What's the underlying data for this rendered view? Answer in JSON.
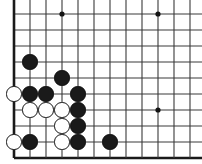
{
  "diagram": {
    "kind": "go-board-diagram"
  },
  "board": {
    "size": 19,
    "visible_columns": 12,
    "visible_rows": 10,
    "origin_x": 14,
    "origin_y": 14,
    "cell": 16,
    "line_color": "#3a3a3a",
    "edge_color": "#1a1a1a",
    "line_width": 1.1,
    "edge_width": 2.6,
    "background_color": "#ffffff",
    "left_edge_visible": true,
    "bottom_edge_visible": true,
    "top_edge_visible": false,
    "right_edge_visible": false,
    "columns_px": [
      14,
      30,
      46,
      62,
      78,
      94,
      110,
      126,
      142,
      158,
      174,
      190
    ],
    "rows_px": [
      14,
      30,
      46,
      62,
      78,
      94,
      110,
      126,
      142,
      158
    ]
  },
  "star_points": {
    "color": "#141414",
    "radius": 2.6,
    "points": [
      {
        "name": "star-point-top-left",
        "col": 3,
        "row": 0,
        "x": 62,
        "y": 14
      },
      {
        "name": "star-point-top-right",
        "col": 9,
        "row": 0,
        "x": 158,
        "y": 14
      },
      {
        "name": "star-point-center-right",
        "col": 9,
        "row": 6,
        "x": 158,
        "y": 110
      }
    ]
  },
  "stones": {
    "radius": 7.6,
    "black_color": "#1a1a1a",
    "white_color": "#ffffff",
    "white_outline_color": "#141414",
    "items": [
      {
        "name": "stone-black-b4",
        "color": "black",
        "col": 1,
        "row": 3,
        "x": 30,
        "y": 62
      },
      {
        "name": "stone-black-d5",
        "color": "black",
        "col": 3,
        "row": 4,
        "x": 62,
        "y": 78
      },
      {
        "name": "stone-white-a6",
        "color": "white",
        "col": 0,
        "row": 5,
        "x": 14,
        "y": 94
      },
      {
        "name": "stone-black-b6",
        "color": "black",
        "col": 1,
        "row": 5,
        "x": 30,
        "y": 94
      },
      {
        "name": "stone-black-c6",
        "color": "black",
        "col": 2,
        "row": 5,
        "x": 46,
        "y": 94
      },
      {
        "name": "stone-black-e6",
        "color": "black",
        "col": 4,
        "row": 5,
        "x": 78,
        "y": 94
      },
      {
        "name": "stone-white-b7",
        "color": "white",
        "col": 1,
        "row": 6,
        "x": 30,
        "y": 110
      },
      {
        "name": "stone-white-c7",
        "color": "white",
        "col": 2,
        "row": 6,
        "x": 46,
        "y": 110
      },
      {
        "name": "stone-white-d7",
        "color": "white",
        "col": 3,
        "row": 6,
        "x": 62,
        "y": 110
      },
      {
        "name": "stone-black-e7",
        "color": "black",
        "col": 4,
        "row": 6,
        "x": 78,
        "y": 110
      },
      {
        "name": "stone-white-d8",
        "color": "white",
        "col": 3,
        "row": 7,
        "x": 62,
        "y": 126
      },
      {
        "name": "stone-black-e8",
        "color": "black",
        "col": 4,
        "row": 7,
        "x": 78,
        "y": 126
      },
      {
        "name": "stone-white-a9",
        "color": "white",
        "col": 0,
        "row": 8,
        "x": 14,
        "y": 142
      },
      {
        "name": "stone-black-b9",
        "color": "black",
        "col": 1,
        "row": 8,
        "x": 30,
        "y": 142
      },
      {
        "name": "stone-white-d9",
        "color": "white",
        "col": 3,
        "row": 8,
        "x": 62,
        "y": 142
      },
      {
        "name": "stone-black-e9",
        "color": "black",
        "col": 4,
        "row": 8,
        "x": 78,
        "y": 142
      },
      {
        "name": "stone-black-g9",
        "color": "black",
        "col": 6,
        "row": 8,
        "x": 110,
        "y": 142
      }
    ]
  }
}
